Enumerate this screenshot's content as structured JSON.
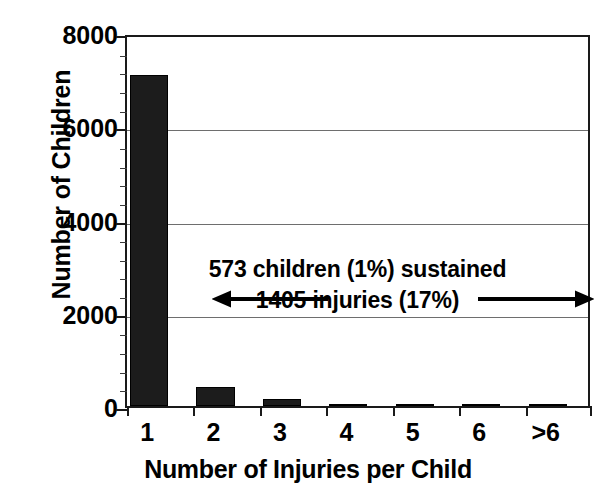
{
  "chart_data": {
    "type": "bar",
    "title": "",
    "xlabel": "Number of Injuries per Child",
    "ylabel": "Number of Children",
    "categories": [
      "1",
      "2",
      "3",
      "4",
      "5",
      "6",
      ">6"
    ],
    "values": [
      7100,
      400,
      150,
      50,
      10,
      5,
      5
    ],
    "ylim": [
      0,
      8000
    ],
    "ytick_labels": [
      "0",
      "2000",
      "4000",
      "6000",
      "8000"
    ],
    "ytick_values": [
      0,
      2000,
      4000,
      6000,
      8000
    ],
    "yminor_interval": 400,
    "grid": "horizontal",
    "legend": "none",
    "bar_color": "#1c1c1c",
    "annotations": [
      {
        "line1": "573 children (1%) sustained",
        "line2": "1405 injuries (17%)",
        "arrow": "double-headed"
      }
    ]
  },
  "axes": {
    "y_title": "Number of Children",
    "x_title": "Number of Injuries per Child"
  },
  "colors": {
    "bar": "#1c1c1c",
    "frame": "#1a1a1a",
    "grid": "#6e6e6e",
    "background": "#ffffff",
    "text": "#000000"
  }
}
